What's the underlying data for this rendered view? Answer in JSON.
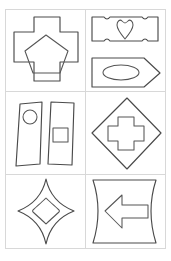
{
  "sheet": {
    "kind": "geometric-shape-worksheet",
    "layout": {
      "rows": 3,
      "columns": 2,
      "panels": 6,
      "border_color": "#d8d8d8",
      "stroke_color": "#4a4a4a",
      "background": "#ffffff"
    },
    "panels": [
      {
        "index": 1,
        "position": "top-left",
        "outer_shape": "cross",
        "inner_shapes": [
          "pentagon"
        ],
        "label": "cross containing pentagon"
      },
      {
        "index": 2,
        "position": "top-right",
        "outer_shape": "concave-corner-rectangle",
        "inner_shapes": [
          "heart",
          "ellipse"
        ],
        "secondary_outer_shape": "right-pointing-arrow-bar",
        "label": "ticket rectangle with heart above arrow bar with ellipse"
      },
      {
        "index": 3,
        "position": "middle-left",
        "outer_shape": "two-slanted-strips",
        "inner_shapes": [
          "circle",
          "square"
        ],
        "label": "two leaning quadrilateral strips holding circle and square"
      },
      {
        "index": 4,
        "position": "middle-right",
        "outer_shape": "diamond",
        "inner_shapes": [
          "cross"
        ],
        "label": "diamond containing cross"
      },
      {
        "index": 5,
        "position": "bottom-left",
        "outer_shape": "four-pointed-star",
        "inner_shapes": [
          "diamond"
        ],
        "label": "four pointed star containing diamond"
      },
      {
        "index": 6,
        "position": "bottom-right",
        "outer_shape": "concave-sided-banner",
        "inner_shapes": [
          "left-pointing-arrow"
        ],
        "label": "banner with curved sides containing left arrow"
      }
    ]
  }
}
